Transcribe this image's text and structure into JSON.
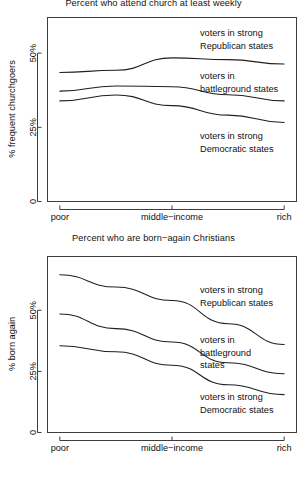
{
  "figure": {
    "background": "#ffffff",
    "line_color": "#1f1f1f",
    "axis_color": "#3d3d3d"
  },
  "panels": {
    "top": {
      "title": "Percent who attend church at least weekly",
      "ylabel": "% frequent churchgoers",
      "ytick_labels": [
        "0",
        "25%",
        "50%"
      ],
      "xtick_labels": [
        "poor",
        "middle−income",
        "rich"
      ],
      "annotations": [
        {
          "line1": "voters in strong",
          "line2": "Republican states"
        },
        {
          "line1": "voters in",
          "line2": "battleground states"
        },
        {
          "line1": "voters in strong",
          "line2": "Democratic states"
        }
      ]
    },
    "bottom": {
      "title": "Percent who are born−again Christians",
      "ylabel": "% born again",
      "ytick_labels": [
        "0",
        "25%",
        "50%"
      ],
      "xtick_labels": [
        "poor",
        "middle−income",
        "rich"
      ],
      "annotations": [
        {
          "line1": "voters in strong",
          "line2": "Republican states"
        },
        {
          "line1": "voters in",
          "line2": "battleground",
          "line3": "states"
        },
        {
          "line1": "voters in strong",
          "line2": "Democratic states"
        }
      ]
    }
  },
  "chart_data": [
    {
      "type": "line",
      "title": "Percent who attend church at least weekly",
      "xlabel": "",
      "ylabel": "% frequent churchgoers",
      "x": [
        1,
        2,
        3,
        4,
        5
      ],
      "xtick_positions": [
        1,
        3,
        5
      ],
      "xtick_labels": [
        "poor",
        "middle−income",
        "rich"
      ],
      "ytick_values": [
        0,
        25,
        50
      ],
      "ytick_labels": [
        "0",
        "25%",
        "50%"
      ],
      "ylim": [
        0,
        62
      ],
      "xlim": [
        0.78,
        5.22
      ],
      "grid": false,
      "legend": "inline-annotations",
      "series": [
        {
          "name": "voters in strong Republican states",
          "values": [
            43.5,
            44.2,
            48.4,
            47.8,
            46.3
          ]
        },
        {
          "name": "voters in battleground states",
          "values": [
            37.2,
            38.9,
            38.7,
            36.0,
            33.9
          ]
        },
        {
          "name": "voters in strong Democratic states",
          "values": [
            33.9,
            35.9,
            32.3,
            29.1,
            26.6
          ]
        }
      ]
    },
    {
      "type": "line",
      "title": "Percent who are born−again Christians",
      "xlabel": "",
      "ylabel": "% born again",
      "x": [
        1,
        2,
        3,
        4,
        5
      ],
      "xtick_positions": [
        1,
        3,
        5
      ],
      "xtick_labels": [
        "poor",
        "middle−income",
        "rich"
      ],
      "ytick_values": [
        0,
        25,
        50
      ],
      "ytick_labels": [
        "0",
        "25%",
        "50%"
      ],
      "ylim": [
        0,
        72
      ],
      "xlim": [
        0.78,
        5.22
      ],
      "grid": false,
      "legend": "inline-annotations",
      "series": [
        {
          "name": "voters in strong Republican states",
          "values": [
            64.5,
            59.5,
            54.0,
            44.5,
            36.0
          ]
        },
        {
          "name": "voters in battleground states",
          "values": [
            48.5,
            42.5,
            37.0,
            28.5,
            24.0
          ]
        },
        {
          "name": "voters in strong Democratic states",
          "values": [
            35.5,
            33.0,
            27.5,
            19.5,
            15.5
          ]
        }
      ]
    }
  ]
}
